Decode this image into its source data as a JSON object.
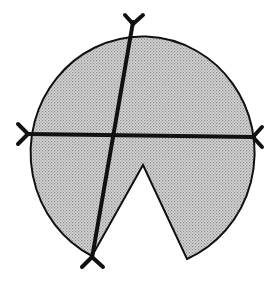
{
  "diagram": {
    "colors": {
      "background": "#ffffff",
      "fill": "#c8c8c8",
      "fill_dot": "#8a8a8a",
      "stroke": "#111111"
    },
    "shape": {
      "center": [
        141,
        142
      ],
      "rx": 112,
      "ry": 116,
      "wedge_apex": [
        143,
        165
      ],
      "wedge_left_end": [
        92,
        256
      ],
      "wedge_right_end": [
        187,
        259
      ]
    },
    "lines": [
      {
        "name": "horizontal-chord",
        "from": [
          27,
          134
        ],
        "to": [
          254,
          137
        ]
      },
      {
        "name": "slanted-chord",
        "from": [
          133,
          22
        ],
        "to": [
          92,
          258
        ]
      }
    ],
    "markers": [
      {
        "name": "top",
        "at": [
          133,
          22
        ]
      },
      {
        "name": "left",
        "at": [
          27,
          134
        ]
      },
      {
        "name": "right",
        "at": [
          254,
          137
        ]
      },
      {
        "name": "bottom",
        "at": [
          92,
          258
        ]
      }
    ]
  }
}
